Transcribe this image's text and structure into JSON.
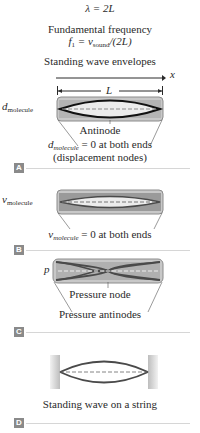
{
  "header": {
    "wavelength_eq": "λ = 2L",
    "fundamental_label": "Fundamental frequency",
    "fundamental_eq_f": "f",
    "fundamental_eq_sub1": "1",
    "fundamental_eq_mid": " = v",
    "fundamental_eq_sub2": "sound",
    "fundamental_eq_end": "/(2L)",
    "envelopes_title": "Standing wave envelopes",
    "x_axis_label": "x",
    "length_label": "L"
  },
  "panels": [
    {
      "badge": "A",
      "y_label": "d",
      "y_label_sub": "molecule",
      "center_label": "Antinode",
      "caption_line1_var": "d",
      "caption_line1_sub": "molecule",
      "caption_line1_rest": " = 0 at both ends",
      "caption_line2": "(displacement nodes)"
    },
    {
      "badge": "B",
      "y_label": "v",
      "y_label_sub": "molecule",
      "caption_line1_var": "v",
      "caption_line1_sub": "molecule",
      "caption_line1_rest": " = 0 at both ends"
    },
    {
      "badge": "C",
      "y_label": "p",
      "center_label": "Pressure node",
      "caption_line1": "Pressure antinodes"
    },
    {
      "badge": "D",
      "caption_line1": "Standing wave on a string"
    }
  ],
  "colors": {
    "tube_fill": "#c8c8c8",
    "tube_dark": "#8c8c8c",
    "envelope_dark": "#1a1a1a",
    "envelope_mid": "#4a4a4a",
    "badge": "#8a8a8a",
    "rule": "#d6d6d6"
  }
}
